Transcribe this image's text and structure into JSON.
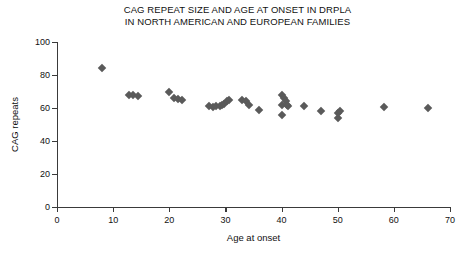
{
  "chart_data": {
    "type": "scatter",
    "title": "CAG REPEAT SIZE AND AGE AT ONSET IN DRPLA IN NORTH AMERICAN AND EUROPEAN FAMILIES",
    "title_lines": [
      "CAG REPEAT SIZE AND AGE AT ONSET IN DRPLA",
      "IN NORTH AMERICAN AND EUROPEAN FAMILIES"
    ],
    "xlabel": "Age at onset",
    "ylabel": "CAG repeats",
    "xlim": [
      0,
      70
    ],
    "ylim": [
      0,
      100
    ],
    "xticks": [
      0,
      10,
      20,
      30,
      40,
      50,
      60,
      70
    ],
    "yticks": [
      0,
      20,
      40,
      60,
      80,
      100
    ],
    "grid": false,
    "legend": null,
    "marker": "diamond",
    "marker_color": "#5a5a5a",
    "x": [
      8,
      12.8,
      13.6,
      14.4,
      20,
      20.8,
      21.6,
      22.2,
      27,
      27.8,
      28.4,
      29,
      29.4,
      29.8,
      30.2,
      30.6,
      33,
      33.6,
      34.2,
      36,
      40,
      40,
      40,
      40.4,
      40.8,
      41,
      41.2,
      44,
      47,
      50,
      50,
      50.4,
      58.2,
      66
    ],
    "y": [
      84,
      68,
      68,
      67.5,
      69.5,
      66,
      65.5,
      65,
      61,
      60.5,
      61,
      61.5,
      62,
      62.5,
      64,
      65,
      65,
      64,
      62,
      59,
      56,
      62,
      68,
      66,
      64,
      62,
      61,
      61,
      58,
      54,
      57,
      58,
      60.5,
      60
    ],
    "points": [
      {
        "x": 8,
        "y": 84
      },
      {
        "x": 12.8,
        "y": 68
      },
      {
        "x": 13.6,
        "y": 68
      },
      {
        "x": 14.4,
        "y": 67.5
      },
      {
        "x": 20,
        "y": 69.5
      },
      {
        "x": 20.8,
        "y": 66
      },
      {
        "x": 21.6,
        "y": 65.5
      },
      {
        "x": 22.2,
        "y": 65
      },
      {
        "x": 27,
        "y": 61
      },
      {
        "x": 27.8,
        "y": 60.5
      },
      {
        "x": 28.4,
        "y": 61
      },
      {
        "x": 29,
        "y": 61.5
      },
      {
        "x": 29.4,
        "y": 62
      },
      {
        "x": 29.8,
        "y": 62.5
      },
      {
        "x": 30.2,
        "y": 64
      },
      {
        "x": 30.6,
        "y": 65
      },
      {
        "x": 33,
        "y": 65
      },
      {
        "x": 33.6,
        "y": 64
      },
      {
        "x": 34.2,
        "y": 62
      },
      {
        "x": 36,
        "y": 59
      },
      {
        "x": 40,
        "y": 56
      },
      {
        "x": 40,
        "y": 62
      },
      {
        "x": 40,
        "y": 68
      },
      {
        "x": 40.4,
        "y": 66
      },
      {
        "x": 40.8,
        "y": 64
      },
      {
        "x": 41,
        "y": 62
      },
      {
        "x": 41.2,
        "y": 61
      },
      {
        "x": 44,
        "y": 61
      },
      {
        "x": 47,
        "y": 58
      },
      {
        "x": 50,
        "y": 54
      },
      {
        "x": 50,
        "y": 57
      },
      {
        "x": 50.4,
        "y": 58
      },
      {
        "x": 58.2,
        "y": 60.5
      },
      {
        "x": 66,
        "y": 60
      }
    ]
  }
}
